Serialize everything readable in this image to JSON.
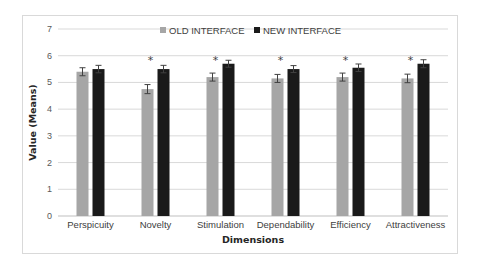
{
  "chart_data": {
    "type": "bar",
    "title": "",
    "xlabel": "Dimensions",
    "ylabel": "Value (Means)",
    "ylim": [
      0,
      7
    ],
    "yticks": [
      0,
      1,
      2,
      3,
      4,
      5,
      6,
      7
    ],
    "grid": true,
    "legend_position": "top",
    "categories": [
      "Perspicuity",
      "Novelty",
      "Stimulation",
      "Dependability",
      "Efficiency",
      "Attractiveness"
    ],
    "series": [
      {
        "name": "OLD INTERFACE",
        "color": "#a6a6a6",
        "values": [
          5.4,
          4.75,
          5.2,
          5.15,
          5.2,
          5.15
        ],
        "error": [
          0.15,
          0.17,
          0.15,
          0.15,
          0.15,
          0.16
        ]
      },
      {
        "name": "NEW INTERFACE",
        "color": "#1a1a1a",
        "values": [
          5.5,
          5.5,
          5.7,
          5.5,
          5.55,
          5.7
        ],
        "error": [
          0.14,
          0.14,
          0.13,
          0.13,
          0.14,
          0.15
        ]
      }
    ],
    "significance_markers": [
      "",
      "*",
      "*",
      "*",
      "*",
      "*"
    ]
  }
}
